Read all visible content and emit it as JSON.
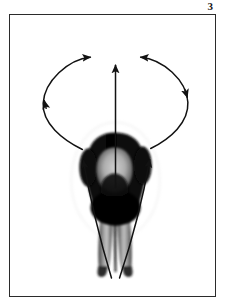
{
  "figure": {
    "number_label": "3",
    "caption_text": "",
    "frame": {
      "border_color": "#2b2b2b",
      "background_color": "#ffffff",
      "x": 9,
      "y": 14,
      "width": 207,
      "height": 283
    },
    "subject": {
      "name": "person-bent-forward-rear-view",
      "description": "Grayscale photograph of a person seen from behind, bent forward at the hips, torso and head in dark clothing, bare legs extending downward to the feet.",
      "torso_color": "#0b0b0b",
      "leg_highlight_color": "#b9b9b9",
      "leg_shadow_color": "#4a4a4a"
    },
    "annotations": {
      "stroke_color": "#121212",
      "arrows": [
        {
          "name": "center-vertical-arrow",
          "type": "straight",
          "direction": "up",
          "tail": {
            "x": 114,
            "y": 186
          },
          "head": {
            "x": 114,
            "y": 62
          },
          "heads": 1
        },
        {
          "name": "left-swing-arc",
          "type": "curved",
          "direction": "counterclockwise-up-and-over",
          "tail": {
            "x": 81,
            "y": 148
          },
          "head": {
            "x": 89,
            "y": 56
          },
          "mid_head": {
            "x": 42,
            "y": 99
          },
          "heads": 2
        },
        {
          "name": "right-swing-arc",
          "type": "curved",
          "direction": "clockwise-up-and-over",
          "tail": {
            "x": 148,
            "y": 147
          },
          "head": {
            "x": 128,
            "y": 57
          },
          "mid_head": {
            "x": 185,
            "y": 94
          },
          "heads": 2
        },
        {
          "name": "left-leg-lift-arrow",
          "type": "curved",
          "direction": "up",
          "tail": {
            "x": 110,
            "y": 272
          },
          "head": {
            "x": 81,
            "y": 149
          },
          "heads": 1
        },
        {
          "name": "right-leg-lift-arrow",
          "type": "curved",
          "direction": "up",
          "tail": {
            "x": 118,
            "y": 272
          },
          "head": {
            "x": 148,
            "y": 148
          },
          "heads": 1
        }
      ]
    }
  }
}
